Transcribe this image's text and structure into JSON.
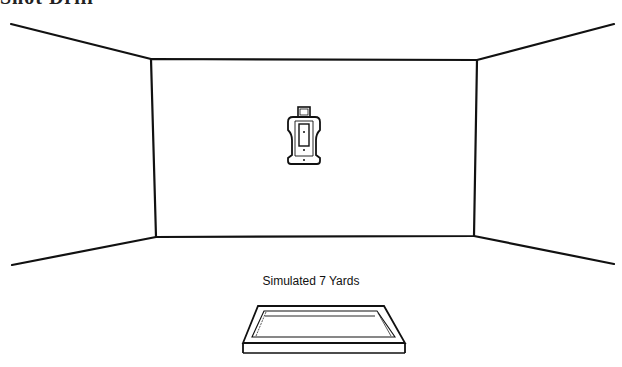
{
  "header": {
    "title_cut": "Shot Drill"
  },
  "range": {
    "distance_label": "Simulated 7 Yards",
    "target": {
      "type": "silhouette-target"
    },
    "stroke_color": "#111111",
    "background": "#ffffff"
  }
}
